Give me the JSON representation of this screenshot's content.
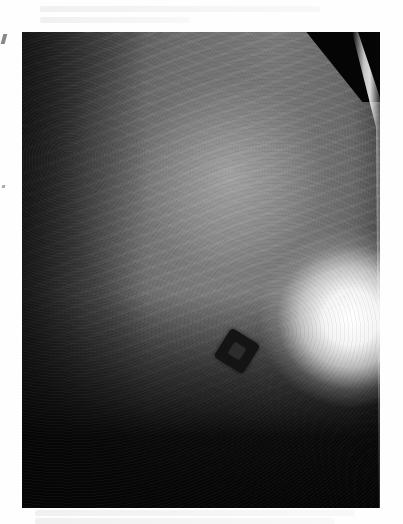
{
  "image": {
    "type": "mammogram",
    "description": "Grayscale breast X-ray with a dense bright mass at lower right and a tilted dark square radiopaque marker in lower center",
    "colors": {
      "background": "#ffffff",
      "film_dark": "#050505",
      "tissue_mid": "#7a7a7a",
      "mass_bright": "#ffffff"
    },
    "features": [
      {
        "name": "bright-mass",
        "position": "lower-right"
      },
      {
        "name": "square-marker",
        "position": "lower-center",
        "rotation_deg": 32
      },
      {
        "name": "skin-line",
        "position": "right-edge"
      }
    ]
  }
}
